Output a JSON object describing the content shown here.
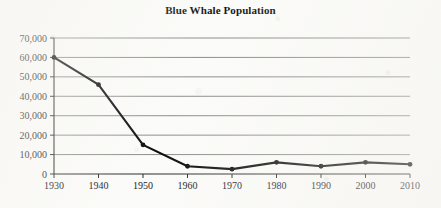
{
  "chart_data": {
    "type": "line",
    "title": "Blue Whale Population",
    "xlabel": "",
    "ylabel": "",
    "x": [
      1930,
      1940,
      1950,
      1960,
      1970,
      1980,
      1990,
      2000,
      2010
    ],
    "values": [
      60000,
      46000,
      15000,
      4000,
      2500,
      6000,
      4000,
      6000,
      5000
    ],
    "series": [
      {
        "name": "Blue Whale Population",
        "values": [
          60000,
          46000,
          15000,
          4000,
          2500,
          6000,
          4000,
          6000,
          5000
        ]
      }
    ],
    "xtick_labels": [
      "1930",
      "1940",
      "1950",
      "1960",
      "1970",
      "1980",
      "1990",
      "2000",
      "2010"
    ],
    "ytick_labels": [
      "0",
      "10,000",
      "20,000",
      "30,000",
      "40,000",
      "50,000",
      "60,000",
      "70,000"
    ],
    "ytick_values": [
      0,
      10000,
      20000,
      30000,
      40000,
      50000,
      60000,
      70000
    ],
    "xlim": [
      1930,
      2010
    ],
    "ylim": [
      0,
      70000
    ],
    "grid": true,
    "grid_axis": "y",
    "legend": false,
    "marker": "circle",
    "line_color": "#0d0d0d",
    "grid_color": "#808080",
    "axis_color": "#2b2b2b",
    "background_color": "#fbfbf9"
  }
}
